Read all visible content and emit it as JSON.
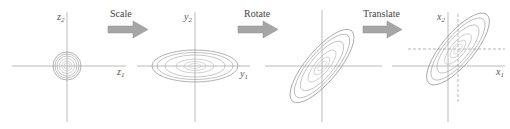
{
  "diagram": {
    "colors": {
      "axis": "#aaaaaa",
      "contour_outer": "#8f8f8f",
      "contour_inner": "#c4c4c4",
      "arrow_fill": "#a6a6a6",
      "arrow_stroke": "#8c8c8c",
      "label_text": "#555555",
      "dashed_line": "#9a9a9a"
    },
    "steps": [
      {
        "label": "Scale"
      },
      {
        "label": "Rotate"
      },
      {
        "label": "Translate"
      }
    ],
    "panels": [
      {
        "name": "z-space",
        "shape": "concentric circles",
        "x_axis": {
          "var": "z",
          "sub": "1"
        },
        "y_axis": {
          "var": "z",
          "sub": "2"
        }
      },
      {
        "name": "y-space (scaled)",
        "shape": "horizontal ellipses",
        "x_axis": {
          "var": "y",
          "sub": "1"
        },
        "y_axis": {
          "var": "y",
          "sub": "2"
        }
      },
      {
        "name": "rotated",
        "shape": "ellipses rotated ~45°",
        "x_axis": {
          "var": "",
          "sub": ""
        },
        "y_axis": {
          "var": "",
          "sub": ""
        }
      },
      {
        "name": "x-space (translated)",
        "shape": "rotated ellipses shifted to mean, dashed lines through mean",
        "x_axis": {
          "var": "x",
          "sub": "1"
        },
        "y_axis": {
          "var": "x",
          "sub": "2"
        }
      }
    ]
  }
}
